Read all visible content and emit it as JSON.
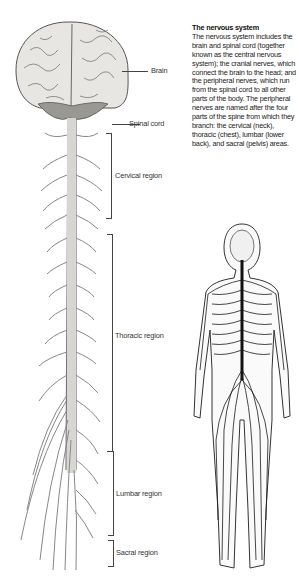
{
  "caption": {
    "title": "The nervous system",
    "body": "The nervous system includes the brain and spinal cord (together known as the central nervous system); the cranial nerves, which connect the brain to the head; and the peripheral nerves, which run from the spinal cord to all other parts of the body. The peripheral nerves are named after the four parts of the spine from which they branch: the cervical (neck), thoracic (chest), lumbar (lower back), and sacral (pelvis) areas."
  },
  "labels": {
    "brain": "Brain",
    "spinal_cord": "Spinal cord",
    "cervical": "Cervical region",
    "thoracic": "Thoracic region",
    "lumbar": "Lumbar region",
    "sacral": "Sacral region"
  },
  "colors": {
    "ink": "#333333",
    "brain_fill": "#e8e6e2",
    "cerebellum_fill": "#9a9893",
    "body_nerves": "#1a1a1a"
  }
}
